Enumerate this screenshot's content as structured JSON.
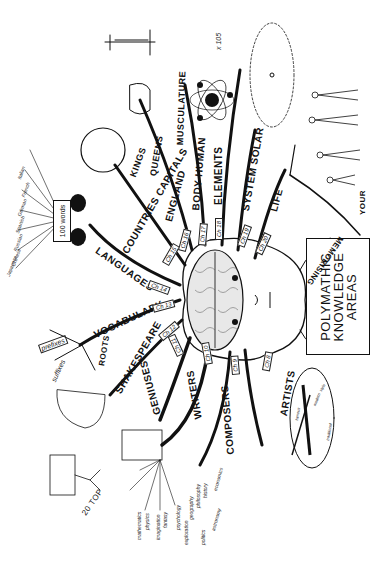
{
  "title": {
    "line1": "POLYMATHIC",
    "line2": "KNOWLEDGE",
    "line3": "AREAS"
  },
  "branches": [
    {
      "label": "ARTISTS",
      "chapter": "Ch 8"
    },
    {
      "label": "COMPOSERS",
      "chapter": "Ch 9"
    },
    {
      "label": "WRITERS",
      "chapter": "Ch 10"
    },
    {
      "label": "GENIUSES",
      "chapter": "Ch 11"
    },
    {
      "label": "SHAKESPEARE",
      "chapter": "Ch 12"
    },
    {
      "label": "VOCABULARY",
      "chapter": "Ch 13"
    },
    {
      "label": "LANGUAGES",
      "chapter": "Ch 14"
    },
    {
      "label": "COUNTRIES CAPITALS",
      "chapter": "Ch 15"
    },
    {
      "label": "ENGLAND",
      "chapter": "Ch 16"
    },
    {
      "label": "BODY HUMAN",
      "chapter": "Ch 17"
    },
    {
      "label": "ELEMENTS",
      "chapter": "Ch 18"
    },
    {
      "label": "SYSTEM SOLAR",
      "chapter": "Ch 19"
    },
    {
      "label": "LIFE",
      "chapter": "Ch 20"
    }
  ],
  "sub_labels": {
    "kings": "KINGS",
    "queens": "QUEENS",
    "musculature": "MUSCULATURE",
    "memorising": "MEMORISING",
    "your": "YOUR",
    "roots": "ROOTS",
    "prefixes": "prefixes",
    "suffixes": "suffixes",
    "top20": "20 TOP",
    "x105": "x 105",
    "words100": "100 words"
  },
  "languages": [
    "Italian",
    "French",
    "German",
    "Spanish",
    "Russian",
    "Chinese",
    "Japanese"
  ],
  "writers_topics": [
    "mathematics",
    "physics",
    "imagination",
    "fantasy",
    "psychology",
    "exploration",
    "geography",
    "philosophy",
    "history",
    "economics",
    "politics",
    "astronomy"
  ],
  "artists_topics": [
    "famous",
    "modern",
    "traditional",
    "style"
  ]
}
